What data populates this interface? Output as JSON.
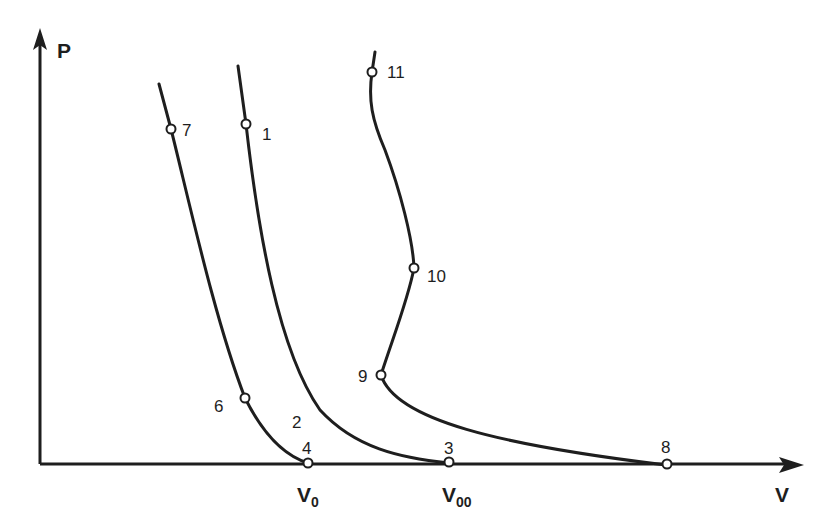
{
  "diagram": {
    "type": "P-V compression curves",
    "colors": {
      "line": "#1e1e1e",
      "background": "#ffffff",
      "marker_fill": "#ffffff"
    },
    "axes": {
      "y_label": "P",
      "x_label": "V",
      "x_ticks": [
        {
          "main": "V",
          "sub": "0"
        },
        {
          "main": "V",
          "sub": "00"
        }
      ]
    },
    "points": [
      {
        "id": "1",
        "label": "1"
      },
      {
        "id": "2",
        "label": "2"
      },
      {
        "id": "3",
        "label": "3"
      },
      {
        "id": "4",
        "label": "4"
      },
      {
        "id": "6",
        "label": "6"
      },
      {
        "id": "7",
        "label": "7"
      },
      {
        "id": "8",
        "label": "8"
      },
      {
        "id": "9",
        "label": "9"
      },
      {
        "id": "10",
        "label": "10"
      },
      {
        "id": "11",
        "label": "11"
      }
    ],
    "curves": [
      {
        "name": "curve-7-6-4",
        "through": [
          "7",
          "6",
          "4"
        ],
        "ends_at": "V0"
      },
      {
        "name": "curve-1-2-3",
        "through": [
          "1",
          "2",
          "3"
        ],
        "ends_at": "V00"
      },
      {
        "name": "curve-11-10-9-8",
        "through": [
          "11",
          "10",
          "9",
          "8"
        ]
      }
    ]
  }
}
